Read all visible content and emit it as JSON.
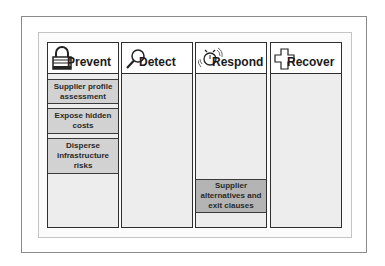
{
  "diagram": {
    "type": "swimlane-columns",
    "columns": [
      {
        "id": "prevent",
        "title": "Prevent",
        "icon": "padlock-icon",
        "cards": [
          {
            "label": "Supplier profile assessment"
          },
          {
            "label": "Expose hidden costs"
          },
          {
            "label": "Disperse infrastructure risks"
          }
        ]
      },
      {
        "id": "detect",
        "title": "Detect",
        "icon": "magnifier-icon",
        "cards": []
      },
      {
        "id": "respond",
        "title": "Respond",
        "icon": "alarm-clock-icon",
        "cards": [
          {
            "label": "Supplier alternatives and exit clauses"
          }
        ]
      },
      {
        "id": "recover",
        "title": "Recover",
        "icon": "medical-cross-icon",
        "cards": []
      }
    ]
  },
  "colors": {
    "border": "#2e2e2e",
    "column_fill": "#ededed",
    "card_fill": "#d2d2d2",
    "card_fill_dark": "#b4b4b4",
    "header_fill": "#ffffff"
  }
}
